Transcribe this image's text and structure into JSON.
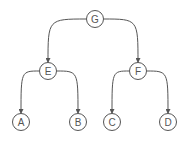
{
  "diagram": {
    "type": "tree",
    "colors": {
      "stroke": "#555555",
      "fill": "#ffffff",
      "text": "#555555"
    },
    "node_radius": 8.5,
    "nodes": [
      {
        "id": "G",
        "label": "G",
        "x": 95,
        "y": 19
      },
      {
        "id": "E",
        "label": "E",
        "x": 48,
        "y": 71
      },
      {
        "id": "F",
        "label": "F",
        "x": 138,
        "y": 71
      },
      {
        "id": "A",
        "label": "A",
        "x": 21,
        "y": 122
      },
      {
        "id": "B",
        "label": "B",
        "x": 78,
        "y": 122
      },
      {
        "id": "C",
        "label": "C",
        "x": 112,
        "y": 122
      },
      {
        "id": "D",
        "label": "D",
        "x": 168,
        "y": 122
      }
    ],
    "edges": [
      {
        "from": "G",
        "to": "E"
      },
      {
        "from": "G",
        "to": "F"
      },
      {
        "from": "E",
        "to": "A"
      },
      {
        "from": "E",
        "to": "B"
      },
      {
        "from": "F",
        "to": "C"
      },
      {
        "from": "F",
        "to": "D"
      }
    ]
  }
}
